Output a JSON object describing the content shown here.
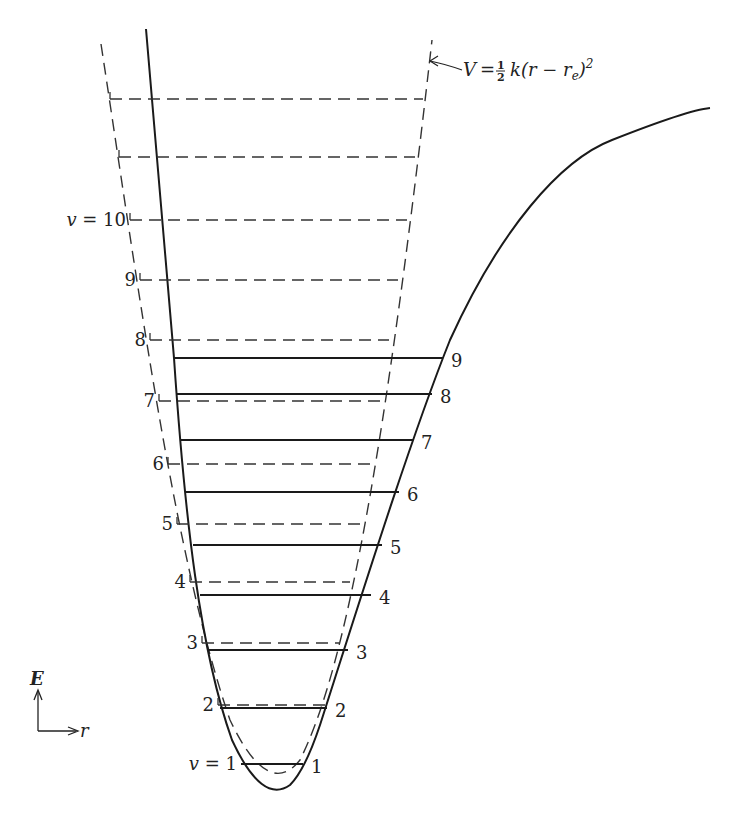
{
  "diagram": {
    "formula_label": "V = ½ k (r − rₑ)²",
    "formula_parts": {
      "lhs": "V",
      "eq": "=",
      "frac_num": "1",
      "frac_den": "2",
      "rhs": "k(r − r",
      "sub": "e",
      "close": ")",
      "sup": "2"
    },
    "axes": {
      "y_label": "E",
      "x_label": "r"
    },
    "harmonic_levels": [
      {
        "label": "",
        "y": 99,
        "x1": 110,
        "x2": 423
      },
      {
        "label": "",
        "y": 157,
        "x1": 119,
        "x2": 415
      },
      {
        "label": "v = 10",
        "y": 220,
        "x1": 130,
        "x2": 407
      },
      {
        "label": "9",
        "y": 280,
        "x1": 140,
        "x2": 398
      },
      {
        "label": "8",
        "y": 340,
        "x1": 150,
        "x2": 389
      },
      {
        "label": "7",
        "y": 401,
        "x1": 159,
        "x2": 380
      },
      {
        "label": "6",
        "y": 464,
        "x1": 168,
        "x2": 371
      },
      {
        "label": "5",
        "y": 524,
        "x1": 177,
        "x2": 361
      },
      {
        "label": "4",
        "y": 582,
        "x1": 190,
        "x2": 350
      },
      {
        "label": "3",
        "y": 643,
        "x1": 202,
        "x2": 339
      },
      {
        "label": "2",
        "y": 705,
        "x1": 218,
        "x2": 325
      },
      {
        "label": "v = 1",
        "y": 764,
        "x1": 241,
        "x2": 303
      }
    ],
    "anharmonic_levels": [
      {
        "label": "9",
        "y": 358,
        "x1": 174,
        "x2": 443
      },
      {
        "label": "8",
        "y": 394,
        "x1": 177,
        "x2": 432
      },
      {
        "label": "7",
        "y": 440,
        "x1": 181,
        "x2": 413
      },
      {
        "label": "6",
        "y": 492,
        "x1": 186,
        "x2": 399
      },
      {
        "label": "5",
        "y": 545,
        "x1": 193,
        "x2": 382
      },
      {
        "label": "4",
        "y": 595,
        "x1": 200,
        "x2": 371
      },
      {
        "label": "3",
        "y": 650,
        "x1": 208,
        "x2": 348
      },
      {
        "label": "2",
        "y": 708,
        "x1": 220,
        "x2": 327
      },
      {
        "label": "1",
        "y": 764,
        "x1": 241,
        "x2": 303
      }
    ],
    "colors": {
      "line": "#1a1a1a",
      "dashed": "#333333",
      "background": "#ffffff"
    }
  }
}
